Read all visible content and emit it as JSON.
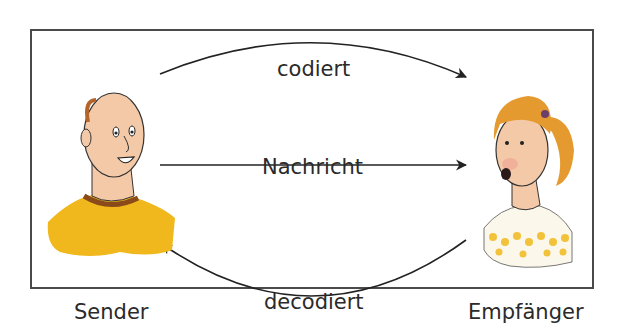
{
  "diagram": {
    "title": "",
    "nodes": [
      {
        "id": "sender",
        "label": "Sender",
        "depiction": "man-with-yellow-shirt"
      },
      {
        "id": "empfaenger",
        "label": "Empfänger",
        "depiction": "girl-with-ponytail-dotted-shirt"
      }
    ],
    "edges": [
      {
        "from": "sender",
        "to": "empfaenger",
        "label": "codiert",
        "style": "curved-top"
      },
      {
        "from": "sender",
        "to": "empfaenger",
        "label": "Nachricht",
        "style": "straight"
      },
      {
        "from": "empfaenger",
        "to": "sender",
        "label": "decodiert",
        "style": "curved-bottom"
      }
    ]
  },
  "labels": {
    "codiert": "codiert",
    "nachricht": "Nachricht",
    "decodiert": "decodiert",
    "sender": "Sender",
    "empfaenger": "Empfänger"
  },
  "colors": {
    "frame": "#4a4a4a",
    "arrow": "#222222",
    "skin": "#f3c9a8",
    "sender_shirt": "#f0b81c",
    "sender_collar": "#8a4a1a",
    "hair_girl": "#e59a30",
    "dots": "#f2c23a"
  }
}
